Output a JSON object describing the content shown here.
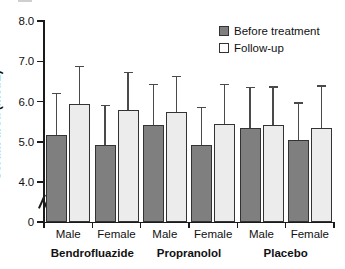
{
  "chart_data": {
    "type": "bar",
    "title": "",
    "xlabel": "",
    "ylabel": "Serum urea (mol/L)",
    "ylim": [
      4.0,
      8.0
    ],
    "yticks": [
      "8.0",
      "7.0",
      "6.0",
      "5.0",
      "4.0",
      "0"
    ],
    "ytick_values": [
      8.0,
      7.0,
      6.0,
      5.0,
      4.0,
      0
    ],
    "axis_break": true,
    "grid": false,
    "legend_position": "top-right",
    "categories": [
      "Male",
      "Female",
      "Male",
      "Female",
      "Male",
      "Female"
    ],
    "groups": [
      "Bendrofluazide",
      "Propranolol",
      "Placebo"
    ],
    "series": [
      {
        "name": "Before treatment",
        "color": "#7f7f7f",
        "values": [
          5.18,
          4.92,
          5.42,
          4.91,
          5.33,
          5.05
        ],
        "errors_upper": [
          6.22,
          5.92,
          6.44,
          5.86,
          6.36,
          5.98
        ]
      },
      {
        "name": "Follow-up",
        "color": "#ececec",
        "values": [
          5.95,
          5.78,
          5.73,
          5.43,
          5.41,
          5.35
        ],
        "errors_upper": [
          6.88,
          6.74,
          6.64,
          6.43,
          6.38,
          6.4
        ]
      }
    ]
  },
  "legend": {
    "items": [
      {
        "label": "Before treatment",
        "swatch": "before"
      },
      {
        "label": "Follow-up",
        "swatch": "after"
      }
    ]
  },
  "axis": {
    "y_title": "Serum urea (mol/L)"
  }
}
